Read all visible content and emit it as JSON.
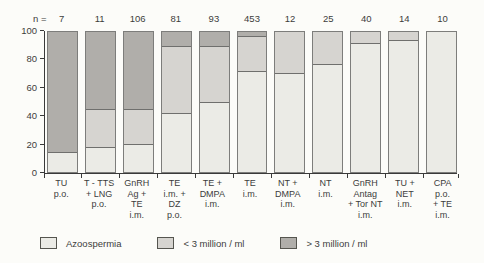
{
  "chart_data": {
    "type": "bar",
    "subtype": "stacked-100-percent",
    "title": "",
    "xlabel": "",
    "ylabel": "",
    "ylim": [
      0,
      100
    ],
    "y_ticks": [
      0,
      20,
      40,
      60,
      80,
      100
    ],
    "grid": false,
    "legend_position": "bottom",
    "n_prefix": "n =",
    "n": [
      7,
      11,
      106,
      81,
      93,
      453,
      12,
      25,
      40,
      14,
      10
    ],
    "categories": [
      "TU p.o.",
      "T-TTS + LNG p.o.",
      "GnRH Ag + TE i.m.",
      "TE i.m. + DZ p.o.",
      "TE + DMPA i.m.",
      "TE i.m.",
      "NT + DMPA i.m.",
      "NT i.m.",
      "GnRH Antag + Tor NT i.m.",
      "TU + NET i.m.",
      "CPA p.o. + TE i.m."
    ],
    "category_label_lines": [
      [
        "TU",
        "p.o."
      ],
      [
        "T - TTS",
        "+ LNG",
        "p.o."
      ],
      [
        "GnRH",
        "Ag +",
        "TE",
        "i.m."
      ],
      [
        "TE",
        "i.m. +",
        "DZ",
        "p.o."
      ],
      [
        "TE +",
        "DMPA",
        "i.m."
      ],
      [
        "TE",
        "i.m."
      ],
      [
        "NT +",
        "DMPA",
        "i.m."
      ],
      [
        "NT",
        "i.m."
      ],
      [
        "GnRH",
        "Antag",
        "+ Tor NT",
        "i.m."
      ],
      [
        "TU +",
        "NET",
        "i.m."
      ],
      [
        "CPA",
        "p.o.",
        "+ TE",
        "i.m."
      ]
    ],
    "series": [
      {
        "name": "Azoospermia",
        "color": "#ebebe6",
        "values": [
          14,
          18,
          20,
          42,
          50,
          72,
          71,
          77,
          92,
          94,
          100
        ]
      },
      {
        "name": "< 3 million / ml",
        "color": "#d6d4d0",
        "values": [
          0,
          27,
          25,
          48,
          40,
          25,
          29,
          23,
          8,
          6,
          0
        ]
      },
      {
        "name": "> 3 million / ml",
        "color": "#b0aeaa",
        "values": [
          86,
          55,
          55,
          10,
          10,
          3,
          0,
          0,
          0,
          0,
          0
        ]
      }
    ]
  }
}
